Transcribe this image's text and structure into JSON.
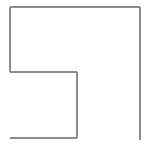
{
  "canvas": {
    "width": 151,
    "height": 147,
    "background_color": "#ffffff",
    "title": "L-shaped outline"
  },
  "figure": {
    "name": "l-shaped-polyline",
    "stroke_color": "#8a8a8a",
    "stroke_width": 1.2,
    "fill": "none",
    "segments": [
      {
        "name": "top-horizontal-line",
        "x1": 10,
        "y1": 7,
        "x2": 140,
        "y2": 7,
        "orientation": "horizontal",
        "length": 130
      },
      {
        "name": "right-vertical-line",
        "x1": 140,
        "y1": 7,
        "x2": 140,
        "y2": 140,
        "orientation": "vertical",
        "length": 133
      },
      {
        "name": "upper-left-vertical-line",
        "x1": 10,
        "y1": 7,
        "x2": 10,
        "y2": 72,
        "orientation": "vertical",
        "length": 65
      },
      {
        "name": "middle-horizontal-line",
        "x1": 10,
        "y1": 72,
        "x2": 77,
        "y2": 72,
        "orientation": "horizontal",
        "length": 67
      },
      {
        "name": "inner-vertical-line",
        "x1": 77,
        "y1": 72,
        "x2": 77,
        "y2": 138,
        "orientation": "vertical",
        "length": 66
      },
      {
        "name": "bottom-horizontal-line",
        "x1": 10,
        "y1": 138,
        "x2": 77,
        "y2": 138,
        "orientation": "horizontal",
        "length": 67
      }
    ],
    "corners": [
      {
        "name": "top-left-corner",
        "x": 10,
        "y": 7
      },
      {
        "name": "top-right-corner",
        "x": 140,
        "y": 7
      },
      {
        "name": "inner-step-corner",
        "x": 10,
        "y": 72
      },
      {
        "name": "inner-notch-corner",
        "x": 77,
        "y": 72
      },
      {
        "name": "bottom-inner-corner",
        "x": 77,
        "y": 138
      }
    ]
  }
}
